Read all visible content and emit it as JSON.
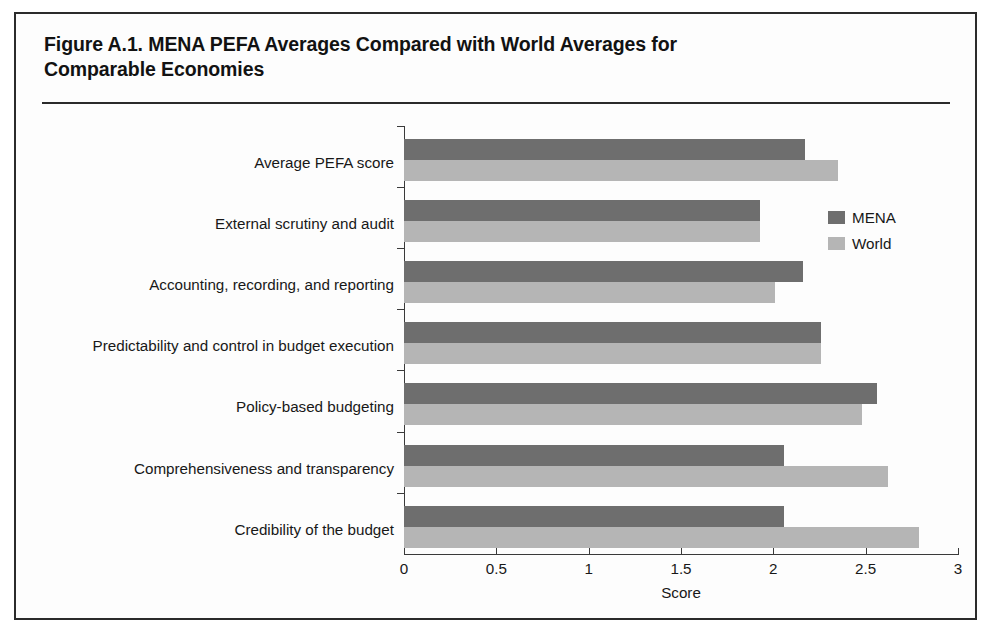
{
  "figure": {
    "title": "Figure A.1. MENA PEFA Averages Compared with World Averages for\nComparable Economies"
  },
  "legend": {
    "position": "top-right",
    "entries": [
      {
        "label": "MENA",
        "color": "#6e6e6e"
      },
      {
        "label": "World",
        "color": "#b5b5b5"
      }
    ]
  },
  "axis": {
    "xlabel": "Score",
    "xticks": [
      "0",
      "0.5",
      "1",
      "1.5",
      "2",
      "2.5",
      "3"
    ]
  },
  "chart_data": {
    "type": "bar",
    "orientation": "horizontal",
    "title": "Figure A.1. MENA PEFA Averages Compared with World Averages for Comparable Economies",
    "xlabel": "Score",
    "ylabel": "",
    "xlim": [
      0,
      3
    ],
    "xticks": [
      0,
      0.5,
      1,
      1.5,
      2,
      2.5,
      3
    ],
    "grid": false,
    "legend_position": "top-right",
    "categories": [
      "Average PEFA score",
      "External scrutiny and audit",
      "Accounting, recording, and reporting",
      "Predictability and control in budget execution",
      "Policy-based budgeting",
      "Comprehensiveness and transparency",
      "Credibility of the budget"
    ],
    "series": [
      {
        "name": "MENA",
        "color": "#6e6e6e",
        "values": [
          2.17,
          1.93,
          2.16,
          2.26,
          2.56,
          2.06,
          2.06
        ]
      },
      {
        "name": "World",
        "color": "#b5b5b5",
        "values": [
          2.35,
          1.93,
          2.01,
          2.26,
          2.48,
          2.62,
          2.79
        ]
      }
    ]
  }
}
